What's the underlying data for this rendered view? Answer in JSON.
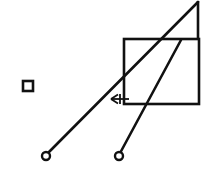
{
  "figure": {
    "background_color": "#ffffff",
    "stroke_color": "#111111",
    "canvas": {
      "width": 212,
      "height": 178
    },
    "elements": {
      "long_diagonal_link": {
        "name": "long-diagonal-link",
        "x1": 46,
        "y1": 155,
        "x2": 198,
        "y2": 2,
        "stroke_width": 2.6
      },
      "short_diagonal_link": {
        "name": "short-diagonal-link",
        "x1": 119,
        "y1": 155,
        "x2": 181,
        "y2": 40,
        "stroke_width": 2.6
      },
      "rectangle_frame": {
        "name": "rectangle-frame",
        "x": 124,
        "y": 39,
        "width": 75,
        "height": 65,
        "stroke_width": 2.6
      },
      "vertical_riser": {
        "name": "vertical-riser",
        "x1": 198,
        "y1": 39,
        "x2": 198,
        "y2": 1,
        "stroke_width": 2.6
      },
      "pivot_left": {
        "name": "pivot-joint-left",
        "cx": 46,
        "cy": 156,
        "r": 4.0,
        "stroke_width": 2.4,
        "fill": "#ffffff"
      },
      "pivot_right": {
        "name": "pivot-joint-right",
        "cx": 119,
        "cy": 156,
        "r": 4.0,
        "stroke_width": 2.4,
        "fill": "#ffffff"
      },
      "small_square_marker": {
        "name": "small-square-marker",
        "x": 23,
        "y": 81,
        "width": 10,
        "height": 10,
        "stroke_width": 2.6,
        "fill": "#ffffff"
      },
      "dimension_arrow": {
        "name": "dimension-arrow-left",
        "x1": 129,
        "y1": 99,
        "x2": 111,
        "y2": 99,
        "stroke_width": 1.8,
        "head_length": 7,
        "head_spread": 4.5
      },
      "tick_mark": {
        "name": "hatch-tick-mark",
        "x1": 120,
        "y1": 94,
        "x2": 120,
        "y2": 104,
        "stroke_width": 1.8
      }
    }
  }
}
